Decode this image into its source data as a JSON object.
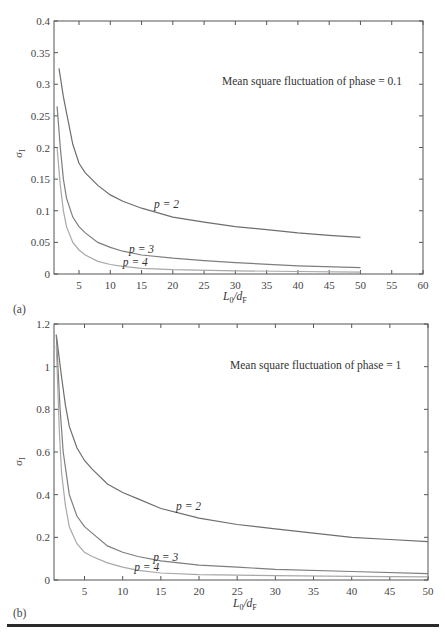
{
  "chart_data": [
    {
      "type": "line",
      "panel": "(a)",
      "title": "",
      "annotation": "Mean square fluctuation of phase = 0.1",
      "xlabel": "L0/dF",
      "ylabel": "σI",
      "xlim": [
        1,
        60
      ],
      "ylim": [
        0,
        0.4
      ],
      "xticks": [
        5,
        10,
        15,
        20,
        25,
        30,
        35,
        40,
        45,
        50,
        55,
        60
      ],
      "yticks": [
        0,
        0.05,
        0.1,
        0.15,
        0.2,
        0.25,
        0.3,
        0.35,
        0.4
      ],
      "ytick_labels": [
        "0",
        "0.05",
        "0.1",
        "0.15",
        "0.2",
        "0.25",
        "0.3",
        "0.35",
        "0.4"
      ],
      "grid": false,
      "series": [
        {
          "name": "p=2",
          "color": "#6e6e6e",
          "label_pos": [
            17,
            0.105
          ],
          "x": [
            1.8,
            2.5,
            3,
            4,
            5,
            6,
            8,
            10,
            12,
            15,
            20,
            25,
            30,
            35,
            40,
            45,
            50
          ],
          "y": [
            0.325,
            0.28,
            0.255,
            0.205,
            0.175,
            0.16,
            0.14,
            0.125,
            0.115,
            0.104,
            0.09,
            0.082,
            0.075,
            0.07,
            0.065,
            0.061,
            0.058
          ]
        },
        {
          "name": "p=3",
          "color": "#7e7e7e",
          "label_pos": [
            13,
            0.033
          ],
          "x": [
            1.5,
            2,
            2.5,
            3,
            4,
            5,
            6,
            8,
            10,
            12,
            15,
            20,
            25,
            30,
            40,
            50
          ],
          "y": [
            0.265,
            0.2,
            0.15,
            0.12,
            0.09,
            0.075,
            0.065,
            0.05,
            0.042,
            0.036,
            0.03,
            0.025,
            0.021,
            0.018,
            0.013,
            0.01
          ]
        },
        {
          "name": "p=4",
          "color": "#a8a8a8",
          "label_pos": [
            12,
            0.012
          ],
          "x": [
            1.5,
            2,
            2.5,
            3,
            4,
            5,
            6,
            8,
            10,
            12,
            15,
            20,
            30,
            40,
            50
          ],
          "y": [
            0.2,
            0.14,
            0.1,
            0.075,
            0.05,
            0.038,
            0.03,
            0.02,
            0.015,
            0.012,
            0.009,
            0.007,
            0.005,
            0.004,
            0.003
          ]
        }
      ]
    },
    {
      "type": "line",
      "panel": "(b)",
      "title": "",
      "annotation": "Mean square fluctuation of phase = 1",
      "xlabel": "L0/dF",
      "ylabel": "σI",
      "xlim": [
        1,
        50
      ],
      "ylim": [
        0,
        1.2
      ],
      "xticks": [
        5,
        10,
        15,
        20,
        25,
        30,
        35,
        40,
        45,
        50
      ],
      "yticks": [
        0,
        0.2,
        0.4,
        0.6,
        0.8,
        1,
        1.2
      ],
      "ytick_labels": [
        "0",
        "0.2",
        "0.4",
        "0.6",
        "0.8",
        "1",
        "1.2"
      ],
      "grid": false,
      "series": [
        {
          "name": "p=2",
          "color": "#6e6e6e",
          "label_pos": [
            17,
            0.33
          ],
          "x": [
            1.3,
            2,
            2.5,
            3,
            4,
            5,
            6,
            8,
            10,
            12,
            15,
            20,
            25,
            30,
            35,
            40,
            45,
            50
          ],
          "y": [
            1.15,
            0.95,
            0.82,
            0.72,
            0.62,
            0.56,
            0.52,
            0.45,
            0.41,
            0.38,
            0.335,
            0.29,
            0.26,
            0.24,
            0.22,
            0.2,
            0.19,
            0.18
          ]
        },
        {
          "name": "p=3",
          "color": "#7e7e7e",
          "label_pos": [
            14,
            0.09
          ],
          "x": [
            1.3,
            1.8,
            2.2,
            3,
            4,
            5,
            6,
            8,
            10,
            12,
            15,
            20,
            25,
            30,
            40,
            50
          ],
          "y": [
            1.15,
            0.8,
            0.6,
            0.4,
            0.3,
            0.25,
            0.22,
            0.16,
            0.13,
            0.11,
            0.09,
            0.07,
            0.06,
            0.05,
            0.04,
            0.03
          ]
        },
        {
          "name": "p=4",
          "color": "#a8a8a8",
          "label_pos": [
            11.5,
            0.04
          ],
          "x": [
            1.3,
            1.7,
            2,
            2.5,
            3,
            4,
            5,
            6,
            8,
            10,
            12,
            15,
            20,
            30,
            40,
            50
          ],
          "y": [
            1.1,
            0.7,
            0.5,
            0.35,
            0.25,
            0.17,
            0.13,
            0.11,
            0.08,
            0.06,
            0.045,
            0.033,
            0.025,
            0.02,
            0.017,
            0.015
          ]
        }
      ]
    }
  ],
  "labels": {
    "panel_a": "(a)",
    "panel_b": "(b)",
    "annotation_a": "Mean square fluctuation of phase = 0.1",
    "annotation_b": "Mean square fluctuation of phase = 1",
    "ylabel_main": "σ",
    "ylabel_sub": "I",
    "xlabel_main_L": "L",
    "xlabel_sub_0": "0",
    "xlabel_slash_d": "/d",
    "xlabel_sub_F": "F"
  }
}
